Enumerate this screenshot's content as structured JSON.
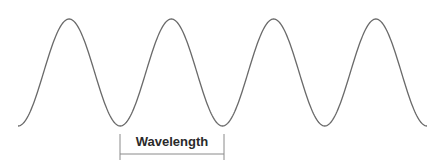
{
  "diagram": {
    "type": "sine-wave",
    "cycles": 4,
    "label": "Wavelength",
    "wave": {
      "start_x": 18,
      "end_x": 427,
      "crest_y": 19,
      "trough_y": 126,
      "stroke": "#6a6a6a"
    },
    "bracket": {
      "x1": 120,
      "x2": 224,
      "top_y": 134,
      "bottom_y": 160,
      "line_y": 154,
      "stroke": "#8a8a8a"
    }
  }
}
